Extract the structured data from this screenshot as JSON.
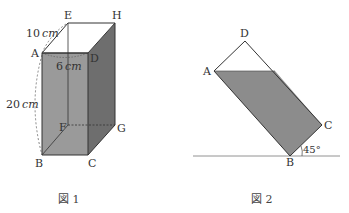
{
  "figure1": {
    "caption": "図 1",
    "vertices": {
      "A": "A",
      "B": "B",
      "C": "C",
      "D": "D",
      "E": "E",
      "F": "F",
      "G": "G",
      "H": "H"
    },
    "dimensions": {
      "depth": {
        "value": "10",
        "unit": "cm"
      },
      "width": {
        "value": "6",
        "unit": "cm"
      },
      "height": {
        "value": "20",
        "unit": "cm"
      }
    },
    "colors": {
      "water": "#8c8c8c",
      "water_side": "#6e6e6e",
      "edge": "#333333"
    }
  },
  "figure2": {
    "caption": "図 2",
    "vertices": {
      "A": "A",
      "B": "B",
      "C": "C",
      "D": "D"
    },
    "angle": "45°",
    "colors": {
      "water": "#8c8c8c",
      "edge": "#333333"
    }
  }
}
